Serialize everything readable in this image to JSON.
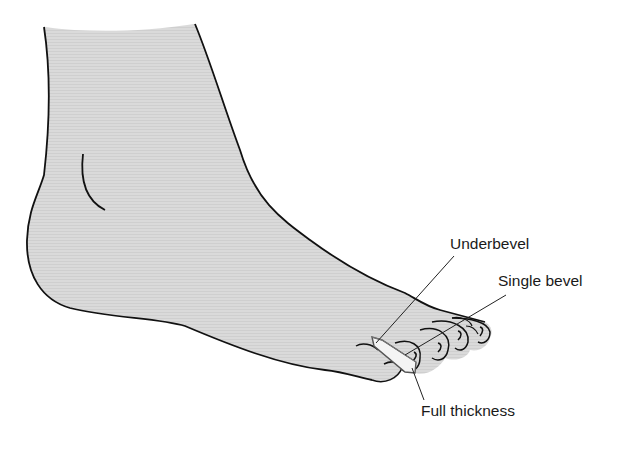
{
  "figure": {
    "fill_color": "#d9d9d9",
    "outline_color": "#111111",
    "splint_color": "#f4f4f4"
  },
  "labels": [
    {
      "id": "underbevel",
      "text": "Underbevel"
    },
    {
      "id": "single_bevel",
      "text": "Single bevel"
    },
    {
      "id": "full_thickness",
      "text": "Full thickness"
    }
  ]
}
